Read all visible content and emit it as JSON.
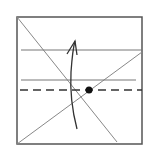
{
  "diagram": {
    "type": "origami-fold-diagram",
    "colors": {
      "background": "#ffffff",
      "border": "#555555",
      "crease": "#888888",
      "horizontal_line": "#777777",
      "dashed_fold": "#333333",
      "arrow": "#333333",
      "dot": "#111111"
    },
    "square": {
      "x": 17,
      "y": 17,
      "width": 125,
      "height": 127
    },
    "elements": {
      "diagonal_top_left": {
        "x1": 17,
        "y1": 17,
        "x2": 117,
        "y2": 142
      },
      "diagonal_bottom_left": {
        "x1": 17,
        "y1": 144,
        "x2": 142,
        "y2": 52
      },
      "horizontal_line_upper": {
        "x1": 21,
        "y1": 50,
        "x2": 142,
        "y2": 50
      },
      "horizontal_line_lower": {
        "x1": 21,
        "y1": 80,
        "x2": 136,
        "y2": 80
      },
      "valley_fold_dashed": {
        "x1": 20,
        "y1": 90,
        "x2": 142,
        "y2": 90,
        "dash": "8 5"
      },
      "reference_point": {
        "cx": 89,
        "cy": 90,
        "r": 3.5
      },
      "fold_arrow": {
        "direction": "up",
        "start": {
          "x": 77,
          "y": 129
        },
        "tip": {
          "x": 75,
          "y": 41
        }
      }
    }
  }
}
